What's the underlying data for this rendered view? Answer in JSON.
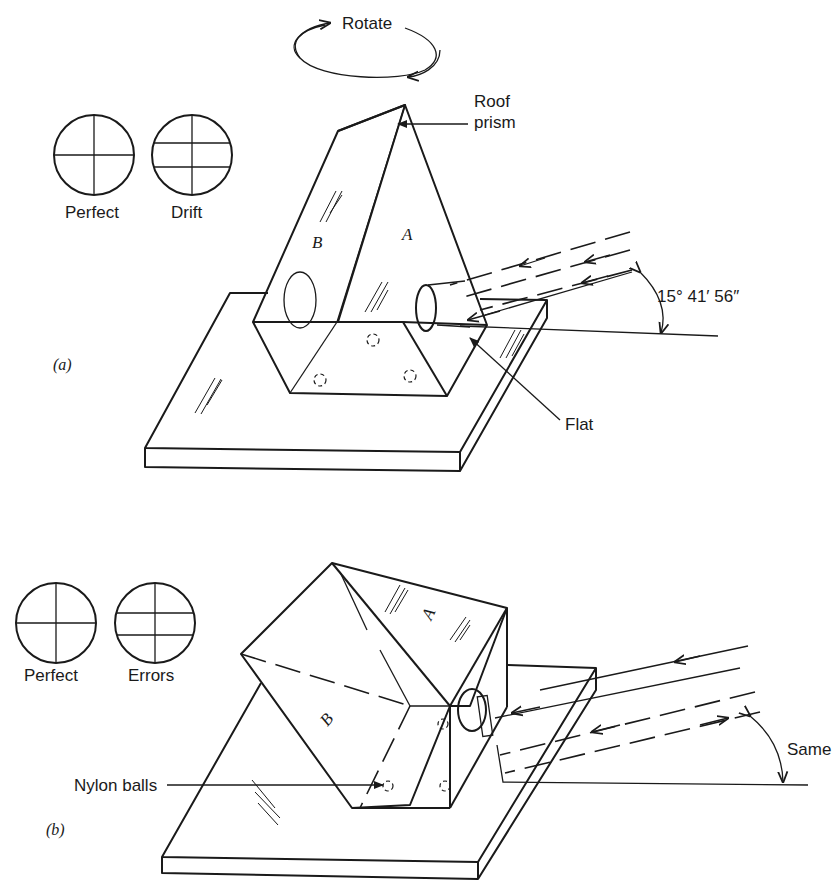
{
  "figure": {
    "top_rotate_label": "Rotate",
    "panel_a": {
      "caption": "(a)",
      "reticle_perfect_label": "Perfect",
      "reticle_drift_label": "Drift",
      "roof_prism_label_line1": "Roof",
      "roof_prism_label_line2": "prism",
      "face_a_label": "A",
      "face_b_label": "B",
      "flat_label": "Flat",
      "angle_label": "15° 41′ 56″"
    },
    "panel_b": {
      "caption": "(b)",
      "reticle_perfect_label": "Perfect",
      "reticle_errors_label": "Errors",
      "face_a_label": "A",
      "face_b_label": "B",
      "nylon_balls_label": "Nylon balls",
      "angle_label": "Same"
    }
  }
}
